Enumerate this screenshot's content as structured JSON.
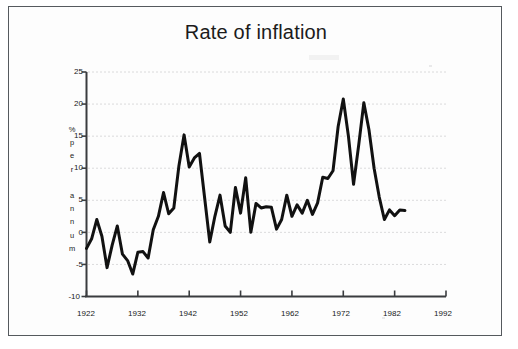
{
  "frame": {
    "border_color": "#555a5e",
    "background": "#fdfdfd"
  },
  "chart_data": {
    "type": "line",
    "title": "Rate of inflation",
    "xlabel": "",
    "ylabel": "% per annum",
    "ylabel_chars": [
      "%",
      "p",
      "e",
      "r",
      "",
      "a",
      "n",
      "n",
      "u",
      "m"
    ],
    "xlim": [
      1922,
      1992
    ],
    "ylim": [
      -10,
      25
    ],
    "xticks": [
      1922,
      1932,
      1942,
      1952,
      1962,
      1972,
      1982,
      1992
    ],
    "xtick_labels": [
      "1922",
      "1932",
      "1942",
      "1952",
      "1962",
      "1972",
      "1982",
      "1992"
    ],
    "yticks": [
      -10,
      -5,
      0,
      5,
      10,
      15,
      20,
      25
    ],
    "ytick_labels": [
      "-10",
      "-5",
      "0",
      "5",
      "10",
      "15",
      "20",
      "25"
    ],
    "grid": true,
    "grid_style": "dotted",
    "grid_color": "#b9b9bb",
    "legend": "none",
    "line_color": "#111111",
    "line_width": 3,
    "series": [
      {
        "name": "Rate of inflation",
        "x": [
          1922,
          1923,
          1924,
          1925,
          1926,
          1927,
          1928,
          1929,
          1930,
          1931,
          1932,
          1933,
          1934,
          1935,
          1936,
          1937,
          1938,
          1939,
          1940,
          1941,
          1942,
          1943,
          1944,
          1945,
          1946,
          1947,
          1948,
          1949,
          1950,
          1951,
          1952,
          1953,
          1954,
          1955,
          1956,
          1957,
          1958,
          1959,
          1960,
          1961,
          1962,
          1963,
          1964,
          1965,
          1966,
          1967,
          1968,
          1969,
          1970,
          1971,
          1972,
          1973,
          1974,
          1975,
          1976,
          1977,
          1978,
          1979,
          1980,
          1981,
          1982,
          1983,
          1984,
          1985,
          1986,
          1987,
          1988,
          1989,
          1990,
          1991,
          1992
        ],
        "values": [
          -2.5,
          -0.8,
          2.0,
          -0.5,
          -5.5,
          -2.0,
          1.0,
          -3.5,
          -4.5,
          -6.5,
          -3.0,
          -3.0,
          -4.0,
          0.5,
          2.5,
          6.2,
          3.0,
          3.8,
          10.5,
          15.2,
          10.2,
          11.5,
          12.3,
          5.5,
          -1.5,
          2.5,
          5.7,
          1.0,
          0.0,
          7.0,
          3.0,
          8.5,
          0.0,
          4.5,
          3.8,
          4.0,
          3.9,
          0.5,
          2.0,
          5.8,
          2.5,
          4.3,
          3.0,
          5.0,
          2.8,
          4.5,
          8.6,
          8.5,
          9.5,
          16.5,
          20.8,
          15.5,
          7.5,
          13.5,
          20.2,
          16.0,
          10.0,
          5.5,
          2.0,
          3.5,
          2.5,
          3.5,
          3.5,
          3.5,
          3.5,
          3.5,
          3.5,
          3.5,
          3.5,
          3.5,
          3.5
        ]
      }
    ],
    "annotations": []
  },
  "series_points": [
    [
      1922,
      -2.5
    ],
    [
      1923,
      -1.0
    ],
    [
      1924,
      2.0
    ],
    [
      1925,
      -0.6
    ],
    [
      1926,
      -5.5
    ],
    [
      1927,
      -2.0
    ],
    [
      1928,
      1.0
    ],
    [
      1929,
      -3.4
    ],
    [
      1930,
      -4.4
    ],
    [
      1931,
      -6.5
    ],
    [
      1932,
      -3.1
    ],
    [
      1933,
      -3.0
    ],
    [
      1934,
      -4.0
    ],
    [
      1935,
      0.4
    ],
    [
      1936,
      2.5
    ],
    [
      1937,
      6.2
    ],
    [
      1938,
      2.9
    ],
    [
      1939,
      3.8
    ],
    [
      1940,
      10.4
    ],
    [
      1941,
      15.2
    ],
    [
      1942,
      10.2
    ],
    [
      1943,
      11.6
    ],
    [
      1944,
      12.3
    ],
    [
      1945,
      5.4
    ],
    [
      1946,
      -1.5
    ],
    [
      1947,
      2.5
    ],
    [
      1948,
      5.8
    ],
    [
      1949,
      1.0
    ],
    [
      1950,
      0.0
    ],
    [
      1951,
      7.0
    ],
    [
      1952,
      3.0
    ],
    [
      1953,
      8.5
    ],
    [
      1954,
      0.0
    ],
    [
      1955,
      4.5
    ],
    [
      1956,
      3.8
    ],
    [
      1957,
      4.0
    ],
    [
      1958,
      3.9
    ],
    [
      1959,
      0.5
    ],
    [
      1960,
      2.0
    ],
    [
      1961,
      5.8
    ],
    [
      1962,
      2.5
    ],
    [
      1963,
      4.3
    ],
    [
      1964,
      3.0
    ],
    [
      1965,
      5.0
    ],
    [
      1966,
      2.8
    ],
    [
      1967,
      4.6
    ],
    [
      1968,
      8.6
    ],
    [
      1969,
      8.4
    ],
    [
      1970,
      9.6
    ],
    [
      1971,
      16.5
    ],
    [
      1972,
      20.8
    ],
    [
      1973,
      15.0
    ],
    [
      1974,
      7.5
    ],
    [
      1975,
      13.6
    ],
    [
      1976,
      20.2
    ],
    [
      1977,
      16.0
    ],
    [
      1978,
      10.0
    ],
    [
      1979,
      5.5
    ],
    [
      1980,
      2.0
    ],
    [
      1981,
      3.5
    ],
    [
      1982,
      2.6
    ],
    [
      1983,
      3.5
    ],
    [
      1984,
      3.4
    ]
  ]
}
